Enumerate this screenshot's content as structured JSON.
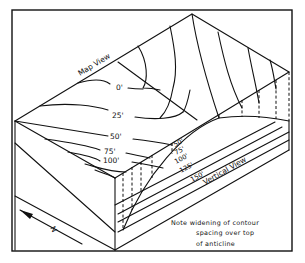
{
  "figure": {
    "map_view_label": "Map View",
    "vertical_view_label": "Vertical View",
    "north_label": "N",
    "map_contours": [
      "0'",
      "25'",
      "50'",
      "75'",
      "100'"
    ],
    "vertical_contours": [
      "50'",
      "75'",
      "100'",
      "125'",
      "150'"
    ],
    "note": {
      "line1": "Note  widening  of  contour",
      "line2": "spacing  over  top",
      "line3": "of  anticline"
    },
    "colors": {
      "ink": "#111111",
      "paper": "#ffffff"
    }
  }
}
